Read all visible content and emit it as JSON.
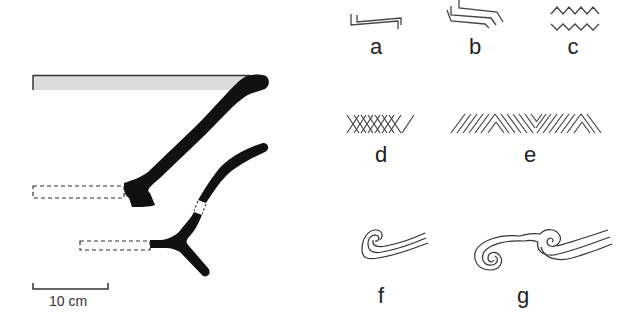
{
  "figure": {
    "colors": {
      "ink": "#111111",
      "line": "#444444",
      "rim_fill": "#dcdcdc",
      "background": "#ffffff"
    }
  },
  "profiles": [
    {
      "id": "profile-upper",
      "name": "Upper vessel profile (rim to base)",
      "reconstructed_base": "dashed outline"
    },
    {
      "id": "profile-lower",
      "name": "Lower vessel profile with foot",
      "reconstructed_base": "dashed outline",
      "joint": "dashed gap"
    }
  ],
  "scale_bar": {
    "label": "10 cm"
  },
  "motifs": [
    {
      "key": "a",
      "label": "a",
      "description": "double stepped line"
    },
    {
      "key": "b",
      "label": "b",
      "description": "triple stepped line"
    },
    {
      "key": "c",
      "label": "c",
      "description": "double zigzag"
    },
    {
      "key": "d",
      "label": "d",
      "description": "cross-hatching"
    },
    {
      "key": "e",
      "label": "e",
      "description": "alternating oblique hatching (herringbone)"
    },
    {
      "key": "f",
      "label": "f",
      "description": "single spiral with triple line"
    },
    {
      "key": "g",
      "label": "g",
      "description": "double spiral with triple line"
    }
  ]
}
